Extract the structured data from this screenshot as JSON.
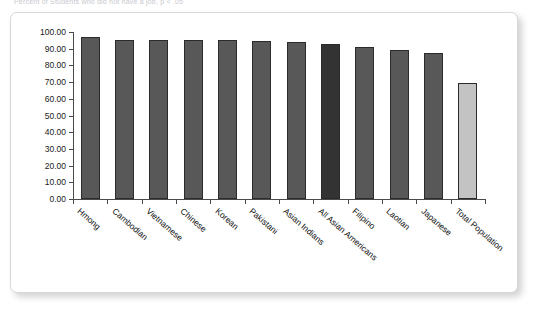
{
  "title_strip": "Percent of Students who did not have a job, p < .05",
  "chart_data": {
    "type": "bar",
    "title": "",
    "xlabel": "",
    "ylabel": "",
    "ylim": [
      0,
      100
    ],
    "ytick_step": 10,
    "grid": false,
    "legend": "none",
    "ytick_labels": [
      "100.00",
      "90.00",
      "80.00",
      "70.00",
      "60.00",
      "50.00",
      "40.00",
      "30.00",
      "20.00",
      "10.00",
      "0.00"
    ],
    "categories": [
      "Hmong",
      "Cambodian",
      "Vietnamese",
      "Chinese",
      "Korean",
      "Pakistani",
      "Asian Indians",
      "All Asian Americans",
      "Filipino",
      "Laotian",
      "Japanese",
      "Total Population"
    ],
    "values": [
      97.0,
      95.5,
      95.3,
      95.2,
      95.0,
      94.8,
      94.0,
      93.0,
      91.3,
      89.2,
      87.3,
      69.5
    ],
    "bar_colors": [
      "#585858",
      "#585858",
      "#585858",
      "#585858",
      "#585858",
      "#585858",
      "#585858",
      "#333333",
      "#585858",
      "#585858",
      "#585858",
      "#c3c3c3"
    ],
    "bar_border_color": "#2b2b2b",
    "axis_color": "#4a4a4a",
    "background_color": "#ffffff"
  }
}
